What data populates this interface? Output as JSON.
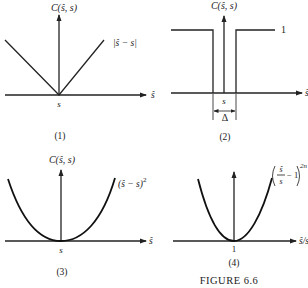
{
  "figure": {
    "caption": "FIGURE 6.6",
    "background": "#ffffff",
    "ink": "#222222"
  },
  "panels": [
    {
      "id": "1",
      "label": "(1)",
      "y_axis_label": "C(ŝ, s)",
      "x_axis_label": "ŝ",
      "x_tick": "s",
      "curve_label": "|ŝ − s|",
      "shape": "absolute-value V"
    },
    {
      "id": "2",
      "label": "(2)",
      "y_axis_label": "C(ŝ, s)",
      "x_axis_label": "ŝ",
      "x_tick": "s",
      "level_label": "1",
      "width_label": "Δ",
      "shape": "inverted rectangular notch (0 within Δ around s, 1 elsewhere)"
    },
    {
      "id": "3",
      "label": "(3)",
      "y_axis_label": "C(ŝ, s)",
      "x_axis_label": "ŝ",
      "x_tick": "s",
      "curve_label_base": "(ŝ − s)",
      "curve_label_exp": "2",
      "shape": "parabola"
    },
    {
      "id": "4",
      "label": "(4)",
      "x_axis_label": "ŝ/s",
      "x_tick": "1",
      "curve_label_num": "ŝ",
      "curve_label_den": "s",
      "curve_label_minus": "− 1",
      "curve_label_exp": "2n",
      "shape": "even-power curve"
    }
  ]
}
